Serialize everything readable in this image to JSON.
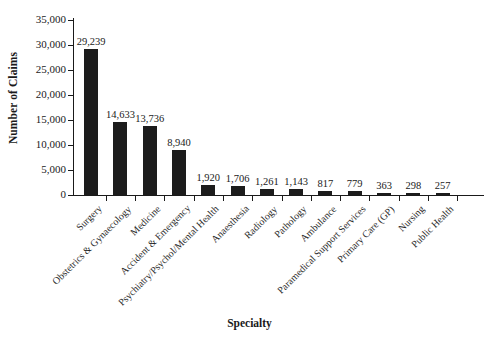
{
  "chart_data": {
    "type": "bar",
    "title": "",
    "xlabel": "Specialty",
    "ylabel": "Number of Claims",
    "ylim": [
      0,
      35000
    ],
    "ytick_values": [
      0,
      5000,
      10000,
      15000,
      20000,
      25000,
      30000,
      35000
    ],
    "ytick_labels": [
      "0",
      "5,000",
      "10,000",
      "15,000",
      "20,000",
      "25,000",
      "30,000",
      "35,000"
    ],
    "grid": false,
    "legend": "none",
    "bar_color": "#1c1c1c",
    "value_label_format": "comma-separated integers above each bar",
    "categories": [
      "Surgery",
      "Obstetrics & Gynaecology",
      "Medicine",
      "Accident & Emergency",
      "Psychiatry/Psychol/Mental Health",
      "Anaesthesia",
      "Radiology",
      "Pathology",
      "Ambulance",
      "Paramedical Support Services",
      "Primary Care (GP)",
      "Nursing",
      "Public Health"
    ],
    "values": [
      29239,
      14633,
      13736,
      8940,
      1920,
      1706,
      1261,
      1143,
      817,
      779,
      363,
      298,
      257
    ],
    "value_labels": [
      "29,239",
      "14,633",
      "13,736",
      "8,940",
      "1,920",
      "1,706",
      "1,261",
      "1,143",
      "817",
      "779",
      "363",
      "298",
      "257"
    ]
  }
}
